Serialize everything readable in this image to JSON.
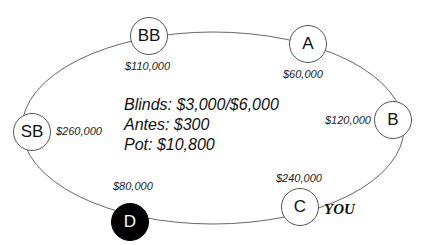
{
  "table": {
    "info": {
      "blinds": "Blinds: $3,000/$6,000",
      "antes": "Antes: $300",
      "pot": "Pot: $10,800"
    },
    "hero_label": "YOU",
    "seats": [
      {
        "id": "BB",
        "label": "BB",
        "stack": "$110,000",
        "dealer": false
      },
      {
        "id": "A",
        "label": "A",
        "stack": "$60,000",
        "dealer": false
      },
      {
        "id": "B",
        "label": "B",
        "stack": "$120,000",
        "dealer": false
      },
      {
        "id": "C",
        "label": "C",
        "stack": "$240,000",
        "dealer": false,
        "hero": true
      },
      {
        "id": "D",
        "label": "D",
        "stack": "$80,000",
        "dealer": true
      },
      {
        "id": "SB",
        "label": "SB",
        "stack": "$260,000",
        "dealer": false
      }
    ],
    "colors": {
      "line": "#555555",
      "dealer": "#000000"
    }
  }
}
